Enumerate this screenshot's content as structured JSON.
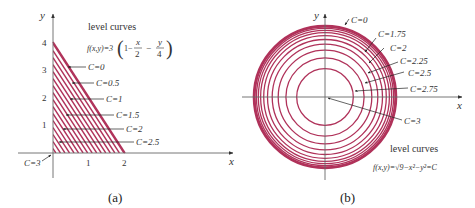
{
  "colors": {
    "curve": "#b0325a",
    "axis": "#555555",
    "text": "#333333",
    "background": "#ffffff"
  },
  "panel_a": {
    "caption": "(a)",
    "x_axis_label": "x",
    "y_axis_label": "y",
    "x_ticks": [
      "1",
      "2"
    ],
    "y_ticks": [
      "1",
      "2",
      "3",
      "4"
    ],
    "title": "level curves",
    "formula_prefix": "f(x,y)=3",
    "formula_one": "1−",
    "formula_x_num": "x",
    "formula_x_den": "2",
    "formula_minus": "−",
    "formula_y_num": "y",
    "formula_y_den": "4",
    "curve_labels": [
      "C=0",
      "C=0.5",
      "C=1",
      "C=1.5",
      "C=2",
      "C=2.5"
    ],
    "origin_label": "C=3"
  },
  "panel_b": {
    "caption": "(b)",
    "x_axis_label": "x",
    "y_axis_label": "y",
    "title": "level curves",
    "formula": "f(x,y)=√9−x²−y²=C",
    "curve_labels": [
      "C=0",
      "C=1.75",
      "C=2",
      "C=2.25",
      "C=2.5",
      "C=2.75",
      "C=3"
    ]
  },
  "chart_data": [
    {
      "type": "line",
      "title": "level curves f(x,y)=3(1 − x/2 − y/4)",
      "xlabel": "x",
      "ylabel": "y",
      "xlim": [
        0,
        2.8
      ],
      "ylim": [
        0,
        4.5
      ],
      "x_ticks": [
        1,
        2
      ],
      "y_ticks": [
        1,
        2,
        3,
        4
      ],
      "grid": false,
      "series": [
        {
          "name": "C=0",
          "x": [
            0,
            2
          ],
          "y": [
            4,
            0
          ]
        },
        {
          "name": "C=0.5",
          "x": [
            0,
            1.667
          ],
          "y": [
            3.333,
            0
          ]
        },
        {
          "name": "C=1",
          "x": [
            0,
            1.333
          ],
          "y": [
            2.667,
            0
          ]
        },
        {
          "name": "C=1.5",
          "x": [
            0,
            1
          ],
          "y": [
            2,
            0
          ]
        },
        {
          "name": "C=2",
          "x": [
            0,
            0.667
          ],
          "y": [
            1.333,
            0
          ]
        },
        {
          "name": "C=2.5",
          "x": [
            0,
            0.333
          ],
          "y": [
            0.667,
            0
          ]
        },
        {
          "name": "C=3",
          "x": [
            0
          ],
          "y": [
            0
          ]
        }
      ]
    },
    {
      "type": "line",
      "title": "level curves f(x,y)=√(9−x²−y²)=C",
      "xlabel": "x",
      "ylabel": "y",
      "grid": false,
      "series": [
        {
          "name": "C=0",
          "radius": 3.0
        },
        {
          "name": "C=0.75",
          "radius": 2.905
        },
        {
          "name": "C=1",
          "radius": 2.828
        },
        {
          "name": "C=1.25",
          "radius": 2.727
        },
        {
          "name": "C=1.5",
          "radius": 2.598
        },
        {
          "name": "C=1.75",
          "radius": 2.437
        },
        {
          "name": "C=2",
          "radius": 2.236
        },
        {
          "name": "C=2.25",
          "radius": 1.984
        },
        {
          "name": "C=2.5",
          "radius": 1.658
        },
        {
          "name": "C=2.75",
          "radius": 1.199
        },
        {
          "name": "C=3",
          "radius": 0
        }
      ]
    }
  ]
}
